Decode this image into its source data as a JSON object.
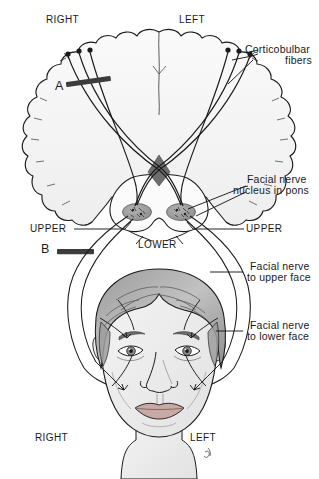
{
  "figure": {
    "type": "anatomical-diagram"
  },
  "colors": {
    "stroke": "#1a1a1a",
    "brain_fill": "#f7f7f7",
    "brain_fill_2": "#f0f0f0",
    "decussation": "#6e6e6e",
    "nucleus": "#9a9a9a",
    "lesion_bar": "#3c3c3c",
    "hair_dark": "#8d8d8d",
    "hair_mid": "#b5b5b5",
    "skin": "#ededed",
    "lip": "#c9a9a4",
    "label_text": "#1a1a1a"
  },
  "labels": {
    "top_right_side": "RIGHT",
    "top_left_side": "LEFT",
    "bottom_right_side": "RIGHT",
    "bottom_left_side": "LEFT",
    "lesion_a": "A",
    "lesion_b": "B",
    "upper_left_nucleus": "UPPER",
    "upper_right_nucleus": "UPPER",
    "lower_nucleus": "LOWER",
    "corticobulbar": {
      "line1": "Corticobulbar",
      "line2": "fibers"
    },
    "nucleus_pons": {
      "line1": "Facial nerve",
      "line2": "nucleus in pons"
    },
    "nerve_upper_face": {
      "line1": "Facial nerve",
      "line2": "to upper face"
    },
    "nerve_lower_face": {
      "line1": "Facial nerve",
      "line2": "to lower face"
    }
  },
  "elements": {
    "cerebrum": "cerebral-hemispheres-outline",
    "pons": "pons-outline",
    "decussation": "corticobulbar-decussation",
    "nucleus_right": "facial-nucleus-right",
    "nucleus_left": "facial-nucleus-left",
    "face": "female-face-illustration",
    "lesion_bar_a": "upper-motor-neuron-lesion-bar",
    "lesion_bar_b": "lower-motor-neuron-lesion-bar"
  }
}
